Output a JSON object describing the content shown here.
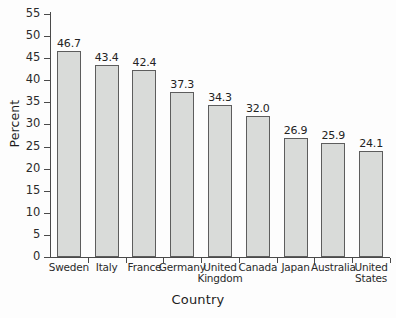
{
  "chart_data": {
    "type": "bar",
    "title": "",
    "xlabel": "Country",
    "ylabel": "Percent",
    "categories": [
      "Sweden",
      "Italy",
      "France",
      "Germany",
      "United\nKingdom",
      "Canada",
      "Japan",
      "Australia",
      "United\nStates"
    ],
    "values": [
      46.7,
      43.4,
      42.4,
      37.3,
      34.3,
      32.0,
      26.9,
      25.9,
      24.1
    ],
    "value_labels": [
      "46.7",
      "43.4",
      "42.4",
      "37.3",
      "34.3",
      "32.0",
      "26.9",
      "25.9",
      "24.1"
    ],
    "ylim": [
      0,
      55
    ],
    "ytick_values": [
      0,
      5,
      10,
      15,
      20,
      25,
      30,
      35,
      40,
      45,
      50,
      55
    ],
    "ytick_labels": [
      "0",
      "5",
      "10",
      "15",
      "20",
      "25",
      "30",
      "35",
      "40",
      "45",
      "50",
      "55"
    ],
    "grid": false,
    "legend": null,
    "bar_fill_color": "#d9dbd9",
    "bar_edge_color": "#5d5d5d",
    "axis_color": "#4a4a4a",
    "background_color": "#fdfdfd"
  }
}
